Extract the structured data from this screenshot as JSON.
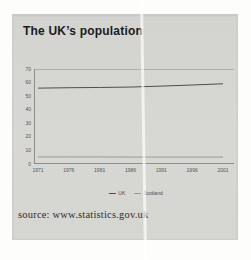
{
  "card": {
    "background": "#d5d5d1"
  },
  "chart_data": {
    "type": "line",
    "title": "The UK’s population",
    "categories": [
      "1971",
      "1976",
      "1981",
      "1986",
      "1991",
      "1996",
      "2001"
    ],
    "series": [
      {
        "name": "UK",
        "color": "#4d4d4d",
        "values": [
          55.9,
          56.2,
          56.4,
          56.7,
          57.4,
          58.2,
          59.1
        ]
      },
      {
        "name": "Scotland",
        "color": "#9b9b97",
        "values": [
          5.2,
          5.2,
          5.2,
          5.1,
          5.1,
          5.1,
          5.1
        ]
      }
    ],
    "ylim": [
      0,
      70
    ],
    "yticks": [
      70,
      60,
      50,
      40,
      30,
      20,
      10,
      0
    ],
    "grid": "single top gridline at 70 only",
    "legend_position": "bottom",
    "source": "source: www.statistics.gov.uk"
  },
  "colors": {
    "axis": "#8d8d89",
    "gridline": "#aeaeaa",
    "tick_label": "#55555a",
    "title_text": "#1b1b1b",
    "source_text": "#2e2e2e",
    "fold_artifact": "#ffffff"
  }
}
